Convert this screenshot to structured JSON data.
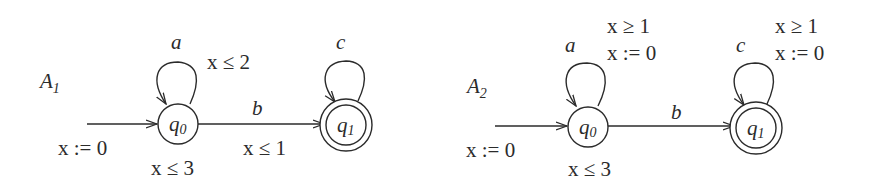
{
  "automata": [
    {
      "name": "A",
      "name_sub": "1",
      "initial": {
        "reset": "x := 0"
      },
      "states": [
        {
          "id": "q0",
          "base": "q",
          "sub": "0",
          "accepting": false,
          "invariant": "x ≤ 3"
        },
        {
          "id": "q1",
          "base": "q",
          "sub": "1",
          "accepting": true,
          "invariant": ""
        }
      ],
      "transitions": [
        {
          "from": "q0",
          "to": "q0",
          "action": "a",
          "guard": "x ≤ 2",
          "reset": ""
        },
        {
          "from": "q0",
          "to": "q1",
          "action": "b",
          "guard": "x ≤ 1",
          "reset": ""
        },
        {
          "from": "q1",
          "to": "q1",
          "action": "c",
          "guard": "",
          "reset": ""
        }
      ]
    },
    {
      "name": "A",
      "name_sub": "2",
      "initial": {
        "reset": "x := 0"
      },
      "states": [
        {
          "id": "q0",
          "base": "q",
          "sub": "0",
          "accepting": false,
          "invariant": "x ≤ 3"
        },
        {
          "id": "q1",
          "base": "q",
          "sub": "1",
          "accepting": true,
          "invariant": ""
        }
      ],
      "transitions": [
        {
          "from": "q0",
          "to": "q0",
          "action": "a",
          "guard": "x ≥ 1",
          "reset": "x := 0"
        },
        {
          "from": "q0",
          "to": "q1",
          "action": "b",
          "guard": "",
          "reset": ""
        },
        {
          "from": "q1",
          "to": "q1",
          "action": "c",
          "guard": "x ≥ 1",
          "reset": "x := 0"
        }
      ]
    }
  ]
}
